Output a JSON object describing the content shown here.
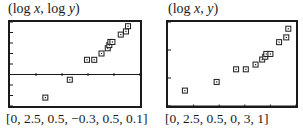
{
  "chart_data": [
    {
      "type": "scatter",
      "title": "(log x, log y)",
      "title_parts": [
        "(log ",
        "x",
        ", log ",
        "y",
        ")"
      ],
      "window": "[0, 2.5, 0.5, −0.3, 0.5, 0.1]",
      "xlim": [
        0,
        2.5
      ],
      "xscl": 0.5,
      "ylim": [
        -0.3,
        0.5
      ],
      "yscl": 0.1,
      "x_axis_visible": true,
      "grid": false,
      "points": [
        [
          0.68,
          -0.22
        ],
        [
          1.15,
          -0.05
        ],
        [
          1.48,
          0.14
        ],
        [
          1.62,
          0.14
        ],
        [
          1.76,
          0.2
        ],
        [
          1.88,
          0.25
        ],
        [
          1.91,
          0.28
        ],
        [
          1.93,
          0.31
        ],
        [
          1.97,
          0.31
        ],
        [
          2.13,
          0.38
        ],
        [
          2.23,
          0.41
        ],
        [
          2.27,
          0.46
        ]
      ]
    },
    {
      "type": "scatter",
      "title": "(log x, y)",
      "title_parts": [
        "(log ",
        "x",
        ", ",
        "y",
        ")"
      ],
      "window": "[0, 2.5, 0.5, 0, 3, 1]",
      "xlim": [
        0,
        2.5
      ],
      "xscl": 0.5,
      "ylim": [
        0,
        3
      ],
      "yscl": 1,
      "x_axis_visible": true,
      "grid": false,
      "points": [
        [
          0.33,
          0.55
        ],
        [
          0.95,
          0.86
        ],
        [
          1.33,
          1.31
        ],
        [
          1.52,
          1.31
        ],
        [
          1.71,
          1.48
        ],
        [
          1.84,
          1.66
        ],
        [
          1.9,
          1.76
        ],
        [
          1.92,
          1.86
        ],
        [
          2.0,
          1.86
        ],
        [
          2.17,
          2.28
        ],
        [
          2.31,
          2.45
        ],
        [
          2.35,
          2.76
        ]
      ]
    }
  ],
  "panels": [
    {
      "title_a": "(log ",
      "title_x": "x",
      "title_b": ", log ",
      "title_y": "y",
      "title_c": ")",
      "window": "[0, 2.5, 0.5, −0.3, 0.5, 0.1]"
    },
    {
      "title_a": "(log ",
      "title_x": "x",
      "title_b": ", ",
      "title_y": "y",
      "title_c": ")",
      "window": "[0, 2.5, 0.5, 0, 3, 1]"
    }
  ]
}
